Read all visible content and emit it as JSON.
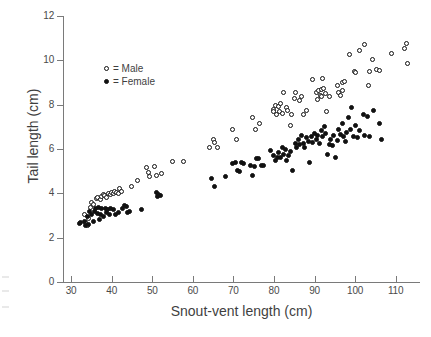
{
  "chart_data": {
    "type": "scatter",
    "title": "",
    "xlabel": "Snout-vent length (cm)",
    "ylabel": "Tail length (cm)",
    "xlim": [
      28,
      116
    ],
    "ylim": [
      0,
      12
    ],
    "xticks": [
      30,
      40,
      50,
      60,
      70,
      80,
      90,
      100,
      110
    ],
    "yticks": [
      0,
      2,
      4,
      6,
      8,
      10,
      12
    ],
    "grid": false,
    "legend_position": "upper-left-inside",
    "legend": [
      {
        "key": "male",
        "marker": "open-circle",
        "label": "= Male"
      },
      {
        "key": "female",
        "marker": "filled-circle",
        "label": "= Female"
      }
    ],
    "series": [
      {
        "name": "Male",
        "marker": "open-circle",
        "color": "#111111",
        "fill": "#ffffff",
        "points": [
          [
            33.2,
            3.05
          ],
          [
            33.6,
            2.7
          ],
          [
            34.0,
            2.55
          ],
          [
            34.3,
            2.85
          ],
          [
            34.8,
            3.35
          ],
          [
            35.0,
            3.6
          ],
          [
            35.6,
            3.5
          ],
          [
            36.2,
            3.75
          ],
          [
            36.6,
            3.8
          ],
          [
            37.2,
            3.7
          ],
          [
            37.6,
            3.85
          ],
          [
            38.0,
            3.95
          ],
          [
            38.3,
            3.9
          ],
          [
            38.8,
            3.8
          ],
          [
            39.2,
            4.0
          ],
          [
            39.6,
            3.95
          ],
          [
            40.0,
            4.05
          ],
          [
            40.4,
            4.0
          ],
          [
            40.8,
            4.1
          ],
          [
            41.2,
            4.05
          ],
          [
            41.6,
            4.0
          ],
          [
            42.0,
            4.2
          ],
          [
            42.4,
            4.1
          ],
          [
            44.8,
            4.3
          ],
          [
            46.4,
            4.6
          ],
          [
            48.6,
            5.15
          ],
          [
            49.0,
            4.95
          ],
          [
            49.2,
            4.75
          ],
          [
            50.6,
            5.2
          ],
          [
            51.0,
            4.8
          ],
          [
            52.4,
            4.9
          ],
          [
            55.0,
            5.45
          ],
          [
            57.6,
            5.45
          ],
          [
            64.2,
            6.05
          ],
          [
            65.0,
            6.45
          ],
          [
            65.4,
            6.3
          ],
          [
            66.2,
            6.05
          ],
          [
            69.8,
            6.9
          ],
          [
            70.8,
            6.45
          ],
          [
            74.6,
            7.4
          ],
          [
            75.4,
            6.9
          ],
          [
            76.4,
            7.15
          ],
          [
            79.8,
            7.8
          ],
          [
            80.0,
            7.7
          ],
          [
            80.4,
            7.95
          ],
          [
            80.6,
            7.55
          ],
          [
            81.0,
            7.9
          ],
          [
            81.3,
            7.7
          ],
          [
            81.6,
            8.05
          ],
          [
            82.0,
            7.6
          ],
          [
            82.4,
            8.55
          ],
          [
            83.0,
            7.85
          ],
          [
            83.4,
            7.75
          ],
          [
            84.2,
            7.05
          ],
          [
            84.4,
            7.55
          ],
          [
            85.0,
            8.3
          ],
          [
            85.4,
            8.55
          ],
          [
            86.4,
            8.2
          ],
          [
            86.8,
            8.35
          ],
          [
            87.2,
            7.55
          ],
          [
            88.0,
            7.75
          ],
          [
            89.6,
            9.15
          ],
          [
            90.6,
            8.55
          ],
          [
            90.8,
            8.25
          ],
          [
            91.0,
            8.65
          ],
          [
            91.4,
            8.4
          ],
          [
            91.6,
            8.7
          ],
          [
            91.8,
            8.35
          ],
          [
            92.0,
            9.2
          ],
          [
            92.2,
            8.75
          ],
          [
            92.6,
            8.5
          ],
          [
            93.0,
            7.7
          ],
          [
            93.6,
            8.35
          ],
          [
            95.6,
            8.85
          ],
          [
            96.0,
            8.55
          ],
          [
            96.4,
            8.4
          ],
          [
            96.8,
            9.0
          ],
          [
            97.0,
            8.65
          ],
          [
            97.4,
            9.05
          ],
          [
            98.6,
            10.25
          ],
          [
            99.8,
            9.5
          ],
          [
            100.2,
            9.45
          ],
          [
            101.0,
            10.45
          ],
          [
            102.4,
            10.7
          ],
          [
            103.4,
            8.85
          ],
          [
            103.6,
            9.5
          ],
          [
            104.4,
            10.05
          ],
          [
            105.4,
            9.6
          ],
          [
            106.0,
            9.55
          ],
          [
            109.0,
            10.3
          ],
          [
            112.2,
            10.55
          ],
          [
            112.6,
            10.75
          ],
          [
            113.0,
            9.85
          ]
        ]
      },
      {
        "name": "Female",
        "marker": "filled-circle",
        "color": "#111111",
        "fill": "#111111",
        "points": [
          [
            32.0,
            2.65
          ],
          [
            32.4,
            2.7
          ],
          [
            33.4,
            2.75
          ],
          [
            33.6,
            2.55
          ],
          [
            34.0,
            2.95
          ],
          [
            34.2,
            2.6
          ],
          [
            34.6,
            3.2
          ],
          [
            35.0,
            3.05
          ],
          [
            35.4,
            2.75
          ],
          [
            35.8,
            3.2
          ],
          [
            36.0,
            3.3
          ],
          [
            36.4,
            3.1
          ],
          [
            36.8,
            3.35
          ],
          [
            37.0,
            2.8
          ],
          [
            37.2,
            3.05
          ],
          [
            37.6,
            3.3
          ],
          [
            38.0,
            2.95
          ],
          [
            38.4,
            3.3
          ],
          [
            38.6,
            3.15
          ],
          [
            39.0,
            3.25
          ],
          [
            39.4,
            3.05
          ],
          [
            39.8,
            3.3
          ],
          [
            40.4,
            3.25
          ],
          [
            41.0,
            3.05
          ],
          [
            41.6,
            3.15
          ],
          [
            42.6,
            3.3
          ],
          [
            43.2,
            3.45
          ],
          [
            43.6,
            3.4
          ],
          [
            44.0,
            3.15
          ],
          [
            44.4,
            3.2
          ],
          [
            47.4,
            3.25
          ],
          [
            51.0,
            4.05
          ],
          [
            51.2,
            3.85
          ],
          [
            51.6,
            3.95
          ],
          [
            52.0,
            3.9
          ],
          [
            64.6,
            4.65
          ],
          [
            65.4,
            4.3
          ],
          [
            68.0,
            4.75
          ],
          [
            69.8,
            5.35
          ],
          [
            70.4,
            5.4
          ],
          [
            71.0,
            5.05
          ],
          [
            71.4,
            5.0
          ],
          [
            72.0,
            5.4
          ],
          [
            72.6,
            5.35
          ],
          [
            74.2,
            5.25
          ],
          [
            74.6,
            4.8
          ],
          [
            75.2,
            5.2
          ],
          [
            75.8,
            5.55
          ],
          [
            76.2,
            5.55
          ],
          [
            77.0,
            5.25
          ],
          [
            77.4,
            5.25
          ],
          [
            79.2,
            5.95
          ],
          [
            80.0,
            5.7
          ],
          [
            80.4,
            5.5
          ],
          [
            80.8,
            5.6
          ],
          [
            81.2,
            5.85
          ],
          [
            81.6,
            5.6
          ],
          [
            82.0,
            6.05
          ],
          [
            82.4,
            5.75
          ],
          [
            82.8,
            6.0
          ],
          [
            83.2,
            5.5
          ],
          [
            83.6,
            5.7
          ],
          [
            84.0,
            5.9
          ],
          [
            84.6,
            5.05
          ],
          [
            85.2,
            6.25
          ],
          [
            85.6,
            6.05
          ],
          [
            86.0,
            6.45
          ],
          [
            86.4,
            6.2
          ],
          [
            86.8,
            6.6
          ],
          [
            87.2,
            6.25
          ],
          [
            87.6,
            6.05
          ],
          [
            88.0,
            6.5
          ],
          [
            88.4,
            6.35
          ],
          [
            88.8,
            5.4
          ],
          [
            89.2,
            6.55
          ],
          [
            89.6,
            6.3
          ],
          [
            90.0,
            6.7
          ],
          [
            90.4,
            6.45
          ],
          [
            90.8,
            6.6
          ],
          [
            91.2,
            6.25
          ],
          [
            91.6,
            6.85
          ],
          [
            92.0,
            6.55
          ],
          [
            92.4,
            7.0
          ],
          [
            92.8,
            6.7
          ],
          [
            93.2,
            5.75
          ],
          [
            93.6,
            6.2
          ],
          [
            94.0,
            6.45
          ],
          [
            94.4,
            6.15
          ],
          [
            94.8,
            6.6
          ],
          [
            95.2,
            5.6
          ],
          [
            95.6,
            6.4
          ],
          [
            96.0,
            6.9
          ],
          [
            96.4,
            6.65
          ],
          [
            96.8,
            7.15
          ],
          [
            97.2,
            6.55
          ],
          [
            97.6,
            6.35
          ],
          [
            98.0,
            6.75
          ],
          [
            98.4,
            7.4
          ],
          [
            98.8,
            6.9
          ],
          [
            99.2,
            7.85
          ],
          [
            99.6,
            6.55
          ],
          [
            100.0,
            7.05
          ],
          [
            100.6,
            6.5
          ],
          [
            101.2,
            6.85
          ],
          [
            102.0,
            7.55
          ],
          [
            102.4,
            6.6
          ],
          [
            103.0,
            7.45
          ],
          [
            103.6,
            6.55
          ],
          [
            104.6,
            7.75
          ],
          [
            106.0,
            7.15
          ],
          [
            106.4,
            6.45
          ]
        ]
      }
    ]
  }
}
